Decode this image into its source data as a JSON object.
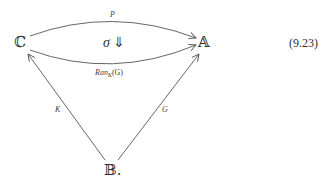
{
  "diagram": {
    "nodes": {
      "C": {
        "label": "ℂ"
      },
      "A": {
        "label": "𝔸"
      },
      "B": {
        "label": "𝔹."
      }
    },
    "edges": {
      "top": {
        "from": "C",
        "to": "A",
        "label": "P"
      },
      "bottom": {
        "from": "C",
        "to": "A",
        "label_main": "Ran",
        "label_sub": "K",
        "label_arg": "(G)"
      },
      "left": {
        "from": "B",
        "to": "C",
        "label": "K"
      },
      "right": {
        "from": "B",
        "to": "A",
        "label": "G"
      }
    },
    "two_cell": {
      "symbol": "σ",
      "arrow": "⇓"
    },
    "equation_number": "(9.23)"
  }
}
